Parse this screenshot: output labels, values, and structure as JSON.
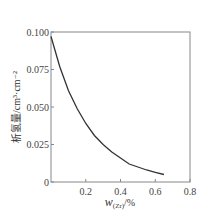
{
  "chart_data": {
    "type": "line",
    "title": "",
    "xlabel": "w(Zr)/%",
    "xlabel_main": "w",
    "xlabel_sub": "(Zr)",
    "xlabel_suffix": "/%",
    "ylabel": "析氢量/cm³·cm⁻²",
    "xlim": [
      0,
      0.8
    ],
    "ylim": [
      0,
      0.1
    ],
    "x_ticks": [
      0.2,
      0.4,
      0.6,
      0.8
    ],
    "x_tick_labels": [
      "0.2",
      "0.4",
      "0.6",
      "0.8"
    ],
    "y_ticks": [
      0,
      0.025,
      0.05,
      0.075,
      0.1
    ],
    "y_tick_labels": [
      "0",
      "0.025",
      "0.050",
      "0.075",
      "0.100"
    ],
    "grid": false,
    "legend": null,
    "series": [
      {
        "name": "析氢量",
        "color": "#333333",
        "x": [
          0.0,
          0.05,
          0.1,
          0.15,
          0.2,
          0.25,
          0.3,
          0.35,
          0.4,
          0.45,
          0.5,
          0.55,
          0.6,
          0.65
        ],
        "y": [
          0.097,
          0.077,
          0.061,
          0.049,
          0.039,
          0.031,
          0.025,
          0.02,
          0.016,
          0.012,
          0.01,
          0.008,
          0.0065,
          0.005
        ]
      }
    ]
  }
}
